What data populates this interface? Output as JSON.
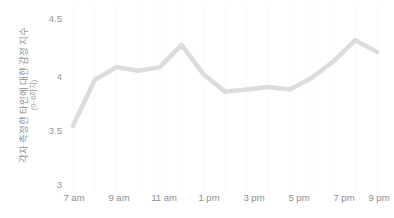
{
  "chart_data": {
    "type": "line",
    "title": "",
    "xlabel": "",
    "ylabel": "각자 측정한 타인에 대한 감정 지수",
    "ylabel_sub": "(0~6까지)",
    "ylim": [
      3,
      4.5
    ],
    "y_ticks": [
      "3",
      "3.5",
      "4",
      "4.5"
    ],
    "y_tick_values": [
      3,
      3.5,
      4,
      4.5
    ],
    "grid": "vertical-faint",
    "legend": "none",
    "line_color": "#dcdcdc",
    "x_tick_labels": [
      "7 am",
      "9 am",
      "11 am",
      "1 pm",
      "3 pm",
      "5 pm",
      "7 pm",
      "9 pm"
    ],
    "x_tick_hours": [
      7,
      9,
      11,
      13,
      15,
      17,
      19,
      21
    ],
    "x": [
      7,
      8,
      9,
      10,
      11,
      12,
      13,
      14,
      15,
      16,
      17,
      18,
      19,
      20,
      21
    ],
    "categories": [
      "7 am",
      "8 am",
      "9 am",
      "10 am",
      "11 am",
      "12 pm",
      "1 pm",
      "2 pm",
      "3 pm",
      "4 pm",
      "5 pm",
      "6 pm",
      "7 pm",
      "8 pm",
      "9 pm"
    ],
    "values": [
      3.53,
      3.92,
      4.03,
      4.0,
      4.03,
      4.22,
      3.97,
      3.82,
      3.84,
      3.86,
      3.84,
      3.94,
      4.08,
      4.26,
      4.16
    ]
  }
}
